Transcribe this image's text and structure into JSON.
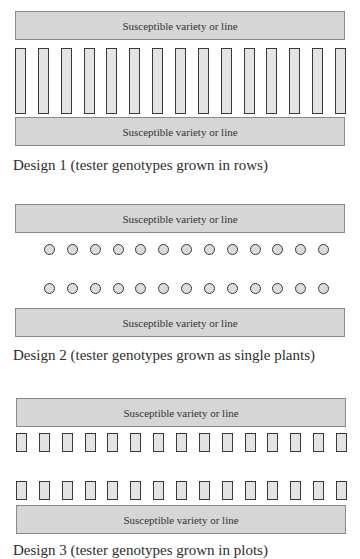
{
  "bar_label": "Susceptible variety or line",
  "designs": [
    {
      "caption": "Design 1  (tester genotypes grown in rows)",
      "tester_shape": "tall-rectangle",
      "tester_rows": 1,
      "testers_per_row": 15
    },
    {
      "caption": "Design 2  (tester genotypes grown as single plants)",
      "tester_shape": "circle",
      "tester_rows": 2,
      "testers_per_row": 13
    },
    {
      "caption": "Design 3  (tester genotypes grown in plots)",
      "tester_shape": "small-rectangle",
      "tester_rows": 2,
      "testers_per_row": 15
    }
  ],
  "colors": {
    "bar_fill": "#d6d6d6",
    "bar_border": "#8a8a8a",
    "tester_fill": "#e4e4e4",
    "tester_border": "#3a3a3a"
  }
}
